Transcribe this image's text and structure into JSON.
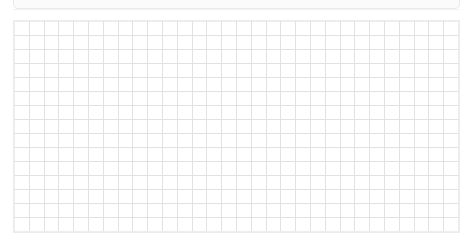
{
  "page": {
    "background_color": "#ffffff",
    "width": 473,
    "height": 252
  },
  "top_bar": {
    "name": "clipped-toolbar",
    "fill_color": "#fbfbfc",
    "border_color": "#e9e9ec",
    "label": ""
  },
  "grid": {
    "columns": 30,
    "rows": 15,
    "cell_width": 14.9,
    "cell_height": 14.2,
    "line_color": "#e2e2e5",
    "outer_line_color": "#ececee",
    "cell_fill_color": "#ffffff",
    "column_headers": [],
    "row_headers": [],
    "cells": []
  }
}
